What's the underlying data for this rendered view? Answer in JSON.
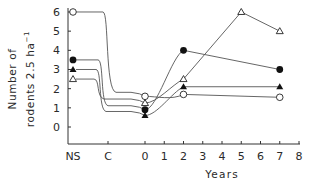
{
  "chart_data": {
    "type": "line",
    "title": "",
    "xlabel": "Years",
    "ylabel_line1": "Number of",
    "ylabel_line2": "rodents 2.5 ha",
    "ylabel_sup": "−1",
    "ylim": [
      -1,
      6
    ],
    "yticks": [
      "0",
      "1",
      "2",
      "3",
      "4",
      "5",
      "6"
    ],
    "x_categories": [
      "NS",
      "C"
    ],
    "xticks": [
      "0",
      "1",
      "2",
      "3",
      "4",
      "5",
      "6",
      "7",
      "8"
    ],
    "grid": false,
    "legend": "none",
    "series": [
      {
        "name": "open-circle",
        "marker": "open-circle",
        "points": [
          {
            "x": "NS",
            "y": 6.0
          },
          {
            "x": 0,
            "y": 1.6
          },
          {
            "x": 2,
            "y": 1.7
          },
          {
            "x": 7,
            "y": 1.55
          }
        ]
      },
      {
        "name": "filled-circle",
        "marker": "filled-circle",
        "points": [
          {
            "x": "NS",
            "y": 3.5
          },
          {
            "x": 0,
            "y": 0.9
          },
          {
            "x": 2,
            "y": 4.0
          },
          {
            "x": 7,
            "y": 3.0
          }
        ]
      },
      {
        "name": "filled-triangle",
        "marker": "filled-triangle",
        "points": [
          {
            "x": "NS",
            "y": 3.0
          },
          {
            "x": 0,
            "y": 0.6
          },
          {
            "x": 2,
            "y": 2.1
          },
          {
            "x": 7,
            "y": 2.1
          }
        ]
      },
      {
        "name": "open-triangle",
        "marker": "open-triangle",
        "points": [
          {
            "x": "NS",
            "y": 2.5
          },
          {
            "x": 0,
            "y": 1.25
          },
          {
            "x": 2,
            "y": 2.5
          },
          {
            "x": 5,
            "y": 6.0
          },
          {
            "x": 7,
            "y": 5.0
          }
        ]
      }
    ]
  },
  "colors": {
    "line": "#555555",
    "marker": "#222222",
    "text": "#2a2a2a"
  }
}
